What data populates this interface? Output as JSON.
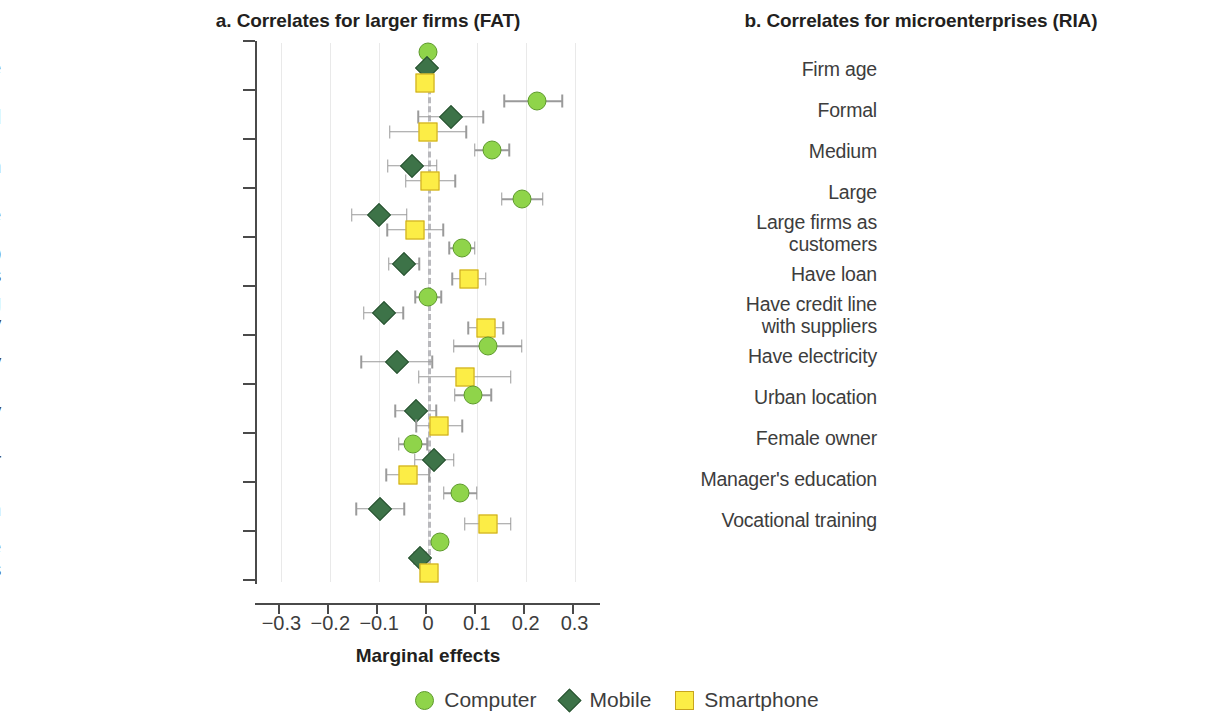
{
  "figure": {
    "legend": [
      {
        "label": "Computer",
        "marker": "circle",
        "color": "#8fd44a"
      },
      {
        "label": "Mobile",
        "marker": "diamond",
        "color": "#3d7348"
      },
      {
        "label": "Smartphone",
        "marker": "square",
        "color": "#fced46"
      }
    ]
  },
  "chart_data": [
    {
      "type": "scatter",
      "panel": "a",
      "title": "a. Correlates for larger firms (FAT)",
      "xlabel": "Marginal effects",
      "ylabel": "",
      "xlim": [
        -0.35,
        0.35
      ],
      "xticks": [
        -0.3,
        -0.2,
        -0.1,
        0,
        0.1,
        0.2,
        0.3
      ],
      "xticklabels": [
        "-0.3",
        "-0.2",
        "-0.1",
        "0",
        "0.1",
        "0.2",
        "0.3"
      ],
      "grid": true,
      "reference_line": 0,
      "legend_position": "bottom",
      "categories": [
        "Firm age",
        "Formal",
        "Medium",
        "Large",
        "Business relationship\nwith MNCs",
        "Loans for purchasing\nmachinery",
        "Have electricity",
        "Located in capital city",
        "Female owner",
        "Manager's education",
        "Manager's experience\nin MNCs"
      ],
      "series": [
        {
          "name": "Computer",
          "marker": "circle",
          "values": [
            0.0,
            0.223,
            0.131,
            0.193,
            0.07,
            0.001,
            0.122,
            0.092,
            -0.031,
            0.066,
            0.025
          ],
          "ci_low": [
            -0.004,
            0.156,
            0.096,
            0.151,
            0.044,
            -0.026,
            0.053,
            0.055,
            -0.06,
            0.032,
            0.013
          ],
          "ci_high": [
            0.004,
            0.275,
            0.166,
            0.235,
            0.096,
            0.027,
            0.192,
            0.129,
            -0.002,
            0.1,
            0.037
          ]
        },
        {
          "name": "Mobile",
          "marker": "diamond",
          "values": [
            -0.003,
            0.047,
            -0.032,
            -0.1,
            -0.049,
            -0.091,
            -0.064,
            -0.025,
            0.013,
            -0.098,
            -0.016
          ],
          "ci_low": [
            -0.008,
            -0.02,
            -0.082,
            -0.156,
            -0.08,
            -0.131,
            -0.137,
            -0.067,
            -0.027,
            -0.147,
            -0.028
          ],
          "ci_high": [
            0.002,
            0.113,
            0.018,
            -0.044,
            -0.018,
            -0.051,
            0.009,
            0.017,
            0.053,
            -0.049,
            -0.004
          ]
        },
        {
          "name": "Smartphone",
          "marker": "square",
          "values": [
            -0.006,
            0.0,
            0.005,
            -0.026,
            0.084,
            0.118,
            0.075,
            0.023,
            -0.041,
            0.122,
            0.003
          ],
          "ci_low": [
            -0.011,
            -0.078,
            -0.046,
            -0.083,
            0.05,
            0.082,
            -0.019,
            -0.024,
            -0.085,
            0.075,
            -0.009
          ],
          "ci_high": [
            -0.001,
            0.078,
            0.056,
            0.031,
            0.118,
            0.154,
            0.169,
            0.07,
            0.003,
            0.169,
            0.015
          ]
        }
      ]
    },
    {
      "type": "scatter",
      "panel": "b",
      "title": "b. Correlates for microenterprises (RIA)",
      "xlabel": "Marginal effects",
      "ylabel": "",
      "xlim": [
        -0.35,
        0.35
      ],
      "xticks": [
        -0.3,
        -0.2,
        -0.1,
        0,
        0.1,
        0.2,
        0.3
      ],
      "xticklabels": [
        "-0.3",
        "-0.2",
        "-0.1",
        "0",
        "0.1",
        "0.2",
        "0.3"
      ],
      "grid": true,
      "reference_line": 0,
      "legend_position": "bottom",
      "categories": [
        "Firm age",
        "Formal",
        "Medium",
        "Large",
        "Large firms as\ncustomers",
        "Have loan",
        "Have credit line\nwith suppliers",
        "Have electricity",
        "Urban location",
        "Female owner",
        "Manager's education",
        "Vocational training"
      ],
      "series": [
        {
          "name": "Computer",
          "marker": "circle",
          "values": [
            0.0,
            0.03,
            0.009,
            0.023,
            0.021,
            0.092,
            0.006,
            0.037,
            0.005,
            -0.029,
            0.006,
            0.022
          ],
          "ci_low": [
            -0.003,
            0.015,
            -0.002,
            0.01,
            0.008,
            0.053,
            -0.004,
            0.023,
            -0.004,
            -0.039,
            -0.001,
            0.01
          ],
          "ci_high": [
            0.003,
            0.046,
            0.02,
            0.037,
            0.035,
            0.131,
            0.016,
            0.051,
            0.014,
            -0.019,
            0.013,
            0.034
          ]
        },
        {
          "name": "Mobile",
          "marker": "diamond",
          "values": [
            -0.002,
            0.004,
            0.069,
            0.02,
            0.009,
            -0.147,
            0.003,
            0.079,
            -0.021,
            0.011,
            0.004,
            0.008
          ],
          "ci_low": [
            -0.005,
            -0.021,
            0.042,
            -0.013,
            -0.024,
            -0.259,
            -0.013,
            0.055,
            -0.04,
            -0.008,
            -0.002,
            -0.017
          ],
          "ci_high": [
            0.001,
            0.029,
            0.096,
            0.053,
            0.042,
            -0.035,
            0.019,
            0.103,
            -0.002,
            0.03,
            0.01,
            0.033
          ]
        },
        {
          "name": "Smartphone",
          "marker": "square",
          "values": [
            -0.004,
            0.011,
            -0.009,
            0.009,
            0.016,
            0.184,
            0.002,
            0.033,
            0.015,
            -0.034,
            0.002,
            0.03
          ],
          "ci_low": [
            -0.007,
            -0.003,
            -0.02,
            -0.005,
            0.001,
            0.107,
            -0.009,
            0.019,
            0.006,
            -0.046,
            -0.005,
            0.017
          ],
          "ci_high": [
            -0.001,
            0.025,
            0.002,
            0.023,
            0.031,
            0.261,
            0.013,
            0.047,
            0.024,
            -0.022,
            0.009,
            0.043
          ]
        }
      ]
    }
  ]
}
